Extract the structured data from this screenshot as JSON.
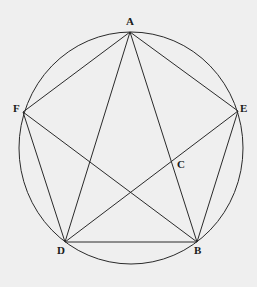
{
  "diagram": {
    "type": "geometry",
    "colors": {
      "background": "#efefef",
      "border": "#ffffff",
      "stroke": "#2a2a2a",
      "label": "#1a1a1a"
    },
    "circle": {
      "cx": 131,
      "cy": 148,
      "rx": 112,
      "ry": 116
    },
    "points": [
      {
        "id": "A",
        "label": "A",
        "x": 130,
        "y": 32,
        "label_x": 126,
        "label_y": 25
      },
      {
        "id": "F",
        "label": "F",
        "x": 23,
        "y": 112,
        "label_x": 13,
        "label_y": 112
      },
      {
        "id": "E",
        "label": "E",
        "x": 238,
        "y": 111,
        "label_x": 240,
        "label_y": 112
      },
      {
        "id": "D",
        "label": "D",
        "x": 65,
        "y": 242,
        "label_x": 57,
        "label_y": 254
      },
      {
        "id": "B",
        "label": "B",
        "x": 197,
        "y": 242,
        "label_x": 194,
        "label_y": 254
      },
      {
        "id": "C",
        "label": "C",
        "x": 173,
        "y": 161,
        "label_x": 177,
        "label_y": 168
      }
    ],
    "segments": [
      [
        "A",
        "F"
      ],
      [
        "A",
        "E"
      ],
      [
        "A",
        "D"
      ],
      [
        "A",
        "B"
      ],
      [
        "F",
        "D"
      ],
      [
        "F",
        "B"
      ],
      [
        "E",
        "D"
      ],
      [
        "E",
        "B"
      ],
      [
        "D",
        "B"
      ]
    ],
    "labels": {
      "A": "A",
      "B": "B",
      "C": "C",
      "D": "D",
      "E": "E",
      "F": "F"
    }
  }
}
